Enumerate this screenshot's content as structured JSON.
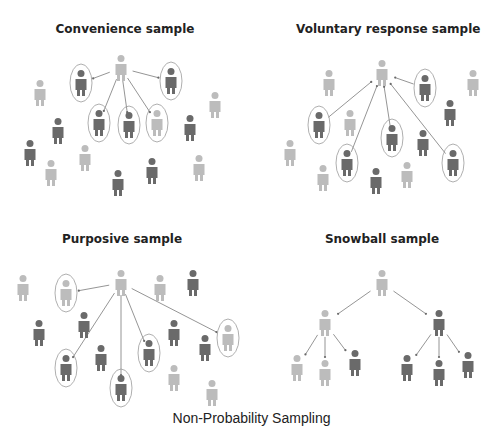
{
  "caption": "Non-Probability Sampling",
  "colors": {
    "light": "#bcbcbc",
    "dark": "#6a6a6a",
    "line": "#7a7a7a",
    "ellipse": "#9a9a9a"
  },
  "panels": [
    {
      "id": "convenience",
      "title": "Convenience sample",
      "title_pos": [
        125,
        30
      ],
      "source": {
        "x": 121,
        "y": 55,
        "tone": "light"
      },
      "selected": [
        {
          "x": 81,
          "y": 70,
          "tone": "dark"
        },
        {
          "x": 171,
          "y": 68,
          "tone": "dark"
        },
        {
          "x": 99,
          "y": 110,
          "tone": "dark"
        },
        {
          "x": 129,
          "y": 112,
          "tone": "dark"
        },
        {
          "x": 157,
          "y": 110,
          "tone": "light"
        }
      ],
      "others": [
        {
          "x": 40,
          "y": 80,
          "tone": "light"
        },
        {
          "x": 215,
          "y": 92,
          "tone": "light"
        },
        {
          "x": 58,
          "y": 118,
          "tone": "dark"
        },
        {
          "x": 190,
          "y": 115,
          "tone": "dark"
        },
        {
          "x": 30,
          "y": 140,
          "tone": "dark"
        },
        {
          "x": 85,
          "y": 145,
          "tone": "light"
        },
        {
          "x": 51,
          "y": 160,
          "tone": "light"
        },
        {
          "x": 118,
          "y": 170,
          "tone": "dark"
        },
        {
          "x": 152,
          "y": 158,
          "tone": "dark"
        },
        {
          "x": 199,
          "y": 155,
          "tone": "light"
        }
      ],
      "arrows_from_source": true
    },
    {
      "id": "voluntary",
      "title": "Voluntary response sample",
      "title_pos": [
        386,
        30
      ],
      "source": {
        "x": 382,
        "y": 60,
        "tone": "light"
      },
      "selected": [
        {
          "x": 425,
          "y": 75,
          "tone": "dark"
        },
        {
          "x": 319,
          "y": 112,
          "tone": "dark"
        },
        {
          "x": 347,
          "y": 150,
          "tone": "dark"
        },
        {
          "x": 392,
          "y": 125,
          "tone": "dark"
        },
        {
          "x": 453,
          "y": 150,
          "tone": "dark"
        }
      ],
      "others": [
        {
          "x": 329,
          "y": 70,
          "tone": "light"
        },
        {
          "x": 473,
          "y": 70,
          "tone": "light"
        },
        {
          "x": 350,
          "y": 110,
          "tone": "light"
        },
        {
          "x": 450,
          "y": 100,
          "tone": "dark"
        },
        {
          "x": 423,
          "y": 130,
          "tone": "dark"
        },
        {
          "x": 290,
          "y": 140,
          "tone": "light"
        },
        {
          "x": 323,
          "y": 165,
          "tone": "light"
        },
        {
          "x": 376,
          "y": 168,
          "tone": "dark"
        },
        {
          "x": 407,
          "y": 162,
          "tone": "light"
        }
      ],
      "arrows_from_source": false
    },
    {
      "id": "purposive",
      "title": "Purposive sample",
      "title_pos": [
        122,
        240
      ],
      "source": {
        "x": 121,
        "y": 270,
        "tone": "light"
      },
      "selected": [
        {
          "x": 66,
          "y": 280,
          "tone": "light"
        },
        {
          "x": 228,
          "y": 325,
          "tone": "light"
        },
        {
          "x": 66,
          "y": 355,
          "tone": "dark"
        },
        {
          "x": 121,
          "y": 375,
          "tone": "dark"
        },
        {
          "x": 149,
          "y": 340,
          "tone": "dark"
        }
      ],
      "others": [
        {
          "x": 23,
          "y": 275,
          "tone": "light"
        },
        {
          "x": 160,
          "y": 275,
          "tone": "light"
        },
        {
          "x": 193,
          "y": 270,
          "tone": "dark"
        },
        {
          "x": 39,
          "y": 320,
          "tone": "dark"
        },
        {
          "x": 84,
          "y": 312,
          "tone": "dark"
        },
        {
          "x": 101,
          "y": 345,
          "tone": "dark"
        },
        {
          "x": 174,
          "y": 320,
          "tone": "dark"
        },
        {
          "x": 205,
          "y": 335,
          "tone": "dark"
        },
        {
          "x": 174,
          "y": 365,
          "tone": "light"
        },
        {
          "x": 212,
          "y": 380,
          "tone": "light"
        }
      ],
      "arrows_from_source": true
    },
    {
      "id": "snowball",
      "title": "Snowball sample",
      "title_pos": [
        382,
        240
      ],
      "tree": {
        "root": {
          "x": 382,
          "y": 270,
          "tone": "light"
        },
        "level2": [
          {
            "x": 325,
            "y": 310,
            "tone": "light",
            "children": [
              {
                "x": 297,
                "y": 355,
                "tone": "light"
              },
              {
                "x": 325,
                "y": 360,
                "tone": "light"
              },
              {
                "x": 355,
                "y": 350,
                "tone": "dark"
              }
            ]
          },
          {
            "x": 439,
            "y": 310,
            "tone": "dark",
            "children": [
              {
                "x": 407,
                "y": 355,
                "tone": "dark"
              },
              {
                "x": 439,
                "y": 360,
                "tone": "dark"
              },
              {
                "x": 468,
                "y": 352,
                "tone": "dark"
              }
            ]
          }
        ]
      }
    }
  ]
}
